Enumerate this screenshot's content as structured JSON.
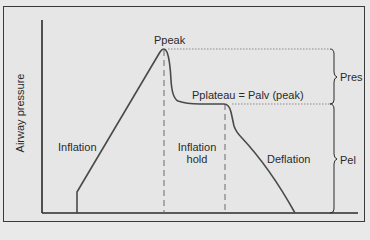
{
  "diagram": {
    "y_axis_label": "Airway pressure",
    "labels": {
      "ppeak": "Ppeak",
      "pplateau": "Pplateau = Palv (peak)",
      "pres": "Pres",
      "pel": "Pel",
      "inflation": "Inflation",
      "inflation_hold_line1": "Inflation",
      "inflation_hold_line2": "hold",
      "deflation": "Deflation"
    },
    "phases": [
      "Inflation",
      "Inflation hold",
      "Deflation"
    ],
    "colors": {
      "background": "#e6e6e6",
      "curve": "#4a4a4a",
      "axis": "#2a2a2a",
      "guide_lines": "#8a8a8a"
    }
  }
}
